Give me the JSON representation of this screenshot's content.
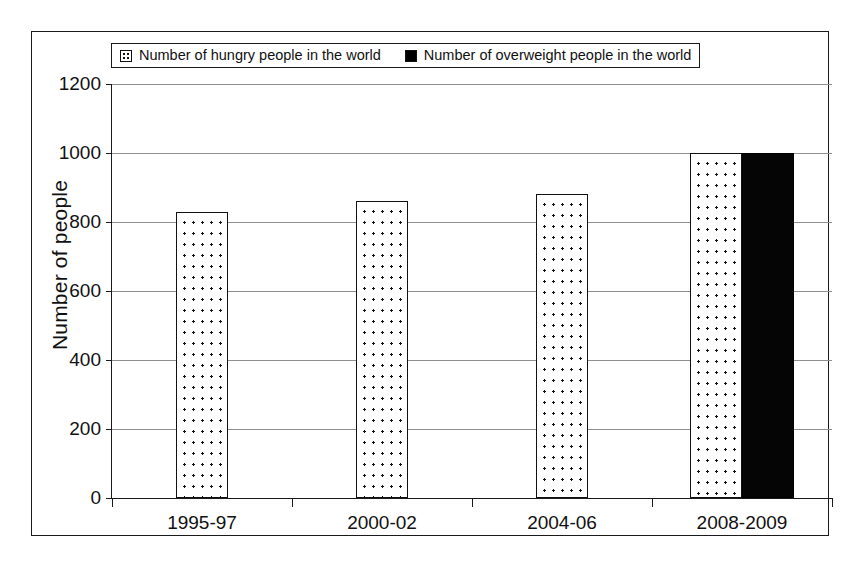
{
  "chart_data": {
    "type": "bar",
    "title": "",
    "xlabel": "",
    "ylabel": "Number of people",
    "categories": [
      "1995-97",
      "2000-02",
      "2004-06",
      "2008-2009"
    ],
    "series": [
      {
        "name": "Number of hungry people in the world",
        "marker": "dotted-square-icon",
        "color": "#ffffff",
        "values": [
          830,
          860,
          880,
          1000
        ]
      },
      {
        "name": "Number of overweight people in the world",
        "marker": "solid-square-icon",
        "color": "#000000",
        "values": [
          null,
          null,
          null,
          1000
        ]
      }
    ],
    "ylim": [
      0,
      1200
    ],
    "yticks": [
      0,
      200,
      400,
      600,
      800,
      1000,
      1200
    ],
    "ytick_labels": [
      "0",
      "200",
      "400",
      "600",
      "800",
      "1000",
      "1200"
    ],
    "grid": true,
    "legend_position": "top"
  },
  "legend": {
    "entries": [
      {
        "label": "Number of hungry people in the world"
      },
      {
        "label": "Number of overweight people in the world"
      }
    ]
  },
  "axes": {
    "y_title": "Number of people"
  }
}
